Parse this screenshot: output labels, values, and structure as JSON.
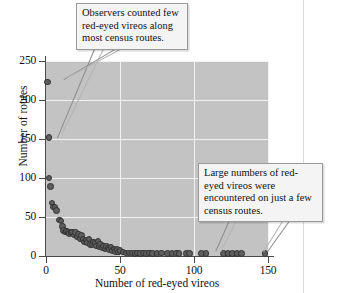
{
  "figure": {
    "kind": "scatterplot-figure"
  },
  "callouts": {
    "left": "Observers counted few red-eyed vireos along most census routes.",
    "right": "Large numbers of red-eyed vireos were encountered on just a few census routes."
  },
  "chart_data": {
    "type": "scatter",
    "title": "",
    "xlabel": "Number of red-eyed vireos",
    "ylabel": "Number of routes",
    "xlim": [
      0,
      150
    ],
    "ylim": [
      0,
      250
    ],
    "xticks": [
      0,
      50,
      100,
      150
    ],
    "yticks": [
      0,
      50,
      100,
      150,
      200,
      250
    ],
    "grid": true,
    "grid_color": "#f2f2f2",
    "panel_color": "#c3c3c3",
    "marker_color": "#5e5e5e",
    "marker_edge_color": "#333333",
    "legend": null,
    "points": [
      [
        1,
        223
      ],
      [
        2,
        152
      ],
      [
        2,
        100
      ],
      [
        3,
        89
      ],
      [
        4,
        68
      ],
      [
        5,
        63
      ],
      [
        6,
        62
      ],
      [
        7,
        58
      ],
      [
        9,
        46
      ],
      [
        10,
        45
      ],
      [
        11,
        38
      ],
      [
        12,
        33
      ],
      [
        13,
        31
      ],
      [
        14,
        32
      ],
      [
        15,
        30
      ],
      [
        16,
        29
      ],
      [
        17,
        30
      ],
      [
        18,
        31
      ],
      [
        19,
        27
      ],
      [
        20,
        30
      ],
      [
        21,
        25
      ],
      [
        22,
        28
      ],
      [
        23,
        22
      ],
      [
        24,
        26
      ],
      [
        25,
        21
      ],
      [
        26,
        18
      ],
      [
        27,
        20
      ],
      [
        28,
        17
      ],
      [
        29,
        22
      ],
      [
        30,
        15
      ],
      [
        31,
        14
      ],
      [
        32,
        18
      ],
      [
        33,
        16
      ],
      [
        34,
        13
      ],
      [
        35,
        19
      ],
      [
        36,
        12
      ],
      [
        37,
        15
      ],
      [
        38,
        11
      ],
      [
        39,
        13
      ],
      [
        40,
        9
      ],
      [
        41,
        12
      ],
      [
        42,
        10
      ],
      [
        43,
        8
      ],
      [
        44,
        11
      ],
      [
        45,
        7
      ],
      [
        46,
        9
      ],
      [
        47,
        6
      ],
      [
        48,
        8
      ],
      [
        49,
        5
      ],
      [
        50,
        7
      ],
      [
        52,
        5
      ],
      [
        54,
        4
      ],
      [
        56,
        4
      ],
      [
        58,
        4
      ],
      [
        60,
        3
      ],
      [
        62,
        4
      ],
      [
        64,
        3
      ],
      [
        66,
        4
      ],
      [
        68,
        3
      ],
      [
        70,
        4
      ],
      [
        72,
        3
      ],
      [
        75,
        3
      ],
      [
        78,
        4
      ],
      [
        82,
        3
      ],
      [
        85,
        3
      ],
      [
        88,
        4
      ],
      [
        90,
        3
      ],
      [
        95,
        3
      ],
      [
        97,
        3
      ],
      [
        105,
        3
      ],
      [
        108,
        3
      ],
      [
        120,
        3
      ],
      [
        123,
        3
      ],
      [
        126,
        3
      ],
      [
        129,
        3
      ],
      [
        132,
        3
      ],
      [
        148,
        3
      ]
    ]
  }
}
